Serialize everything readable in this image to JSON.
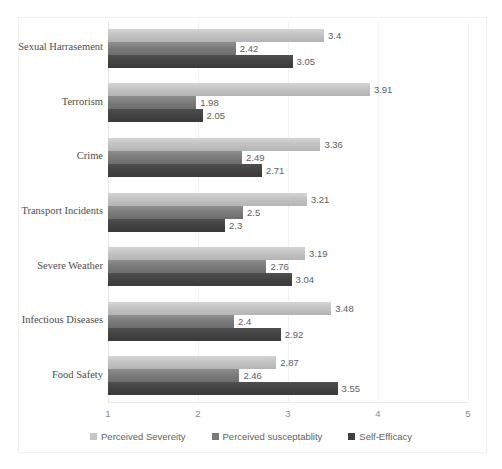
{
  "chart_data": {
    "type": "bar",
    "orientation": "horizontal",
    "title": "",
    "xlabel": "",
    "ylabel": "",
    "xlim": [
      1,
      5
    ],
    "xticks": [
      "1",
      "2",
      "3",
      "4",
      "5"
    ],
    "grid": true,
    "legend_position": "bottom",
    "categories": [
      "Sexual Harrasement",
      "Terrorism",
      "Crime",
      "Transport Incidents",
      "Severe Weather",
      "Infectious Diseases",
      "Food Safety"
    ],
    "series": [
      {
        "name": "Perceived Severeity",
        "color": "#c5c5c5",
        "values": [
          3.4,
          3.91,
          3.36,
          3.21,
          3.19,
          3.48,
          2.87
        ],
        "labels": [
          "3.4",
          "3.91",
          "3.36",
          "3.21",
          "3.19",
          "3.48",
          "2.87"
        ]
      },
      {
        "name": "Perceived susceptablity",
        "color": "#7b7b7b",
        "values": [
          2.42,
          1.98,
          2.49,
          2.5,
          2.76,
          2.4,
          2.46
        ],
        "labels": [
          "2.42",
          "1.98",
          "2.49",
          "2.5",
          "2.76",
          "2.4",
          "2.46"
        ]
      },
      {
        "name": "Self-Efficacy",
        "color": "#3f3f3f",
        "values": [
          3.05,
          2.05,
          2.71,
          2.3,
          3.04,
          2.92,
          3.55
        ],
        "labels": [
          "3.05",
          "2.05",
          "2.71",
          "2.3",
          "3.04",
          "2.92",
          "3.55"
        ]
      }
    ]
  }
}
